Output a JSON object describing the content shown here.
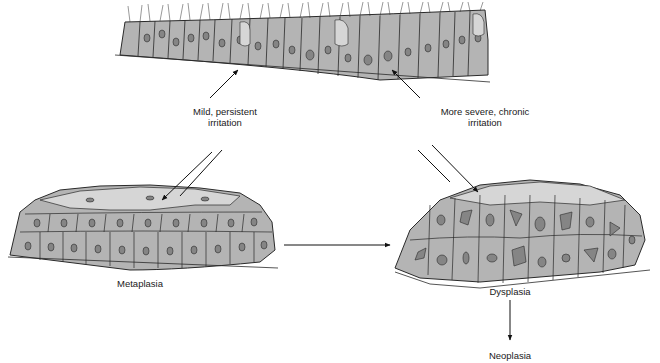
{
  "diagram": {
    "type": "flow",
    "nodes": [
      {
        "id": "normal",
        "label": "",
        "description": "Normal ciliated columnar epithelium"
      },
      {
        "id": "metaplasia",
        "label": "Metaplasia",
        "description": "Stratified squamous epithelium"
      },
      {
        "id": "dysplasia",
        "label": "Dysplasia",
        "description": "Disordered cells with irregular nuclei"
      },
      {
        "id": "neoplasia",
        "label": "Neoplasia"
      }
    ],
    "edges": [
      {
        "from": "normal",
        "to": "metaplasia",
        "label": "Mild, persistent irritation",
        "bidirectional": true
      },
      {
        "from": "normal",
        "to": "dysplasia",
        "label": "More severe, chronic irritation",
        "bidirectional": true
      },
      {
        "from": "metaplasia",
        "to": "dysplasia",
        "label": ""
      },
      {
        "from": "dysplasia",
        "to": "neoplasia",
        "label": ""
      }
    ],
    "labels": {
      "mild_line1": "Mild, persistent",
      "mild_line2": "irritation",
      "severe_line1": "More severe, chronic",
      "severe_line2": "irritation",
      "metaplasia": "Metaplasia",
      "dysplasia": "Dysplasia",
      "neoplasia": "Neoplasia"
    },
    "colors": {
      "cell_fill": "#b4b4b4",
      "cell_top_fill": "#d6d6d6",
      "nucleus_fill": "#858585",
      "outline": "#2a2a2a"
    }
  }
}
